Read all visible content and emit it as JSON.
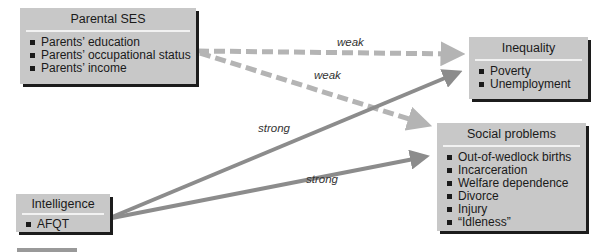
{
  "nodes": {
    "parental_ses": {
      "title": "Parental SES",
      "items": [
        "Parents’ education",
        "Parents’ occupational status",
        "Parents’ income"
      ]
    },
    "intelligence": {
      "title": "Intelligence",
      "items": [
        "AFQT"
      ]
    },
    "inequality": {
      "title": "Inequality",
      "items": [
        "Poverty",
        "Unemployment"
      ]
    },
    "social_problems": {
      "title": "Social problems",
      "items": [
        "Out-of-wedlock births",
        "Incarceration",
        "Welfare dependence",
        "Divorce",
        "Injury",
        "“Idleness”"
      ]
    }
  },
  "edges": [
    {
      "from": "Parental SES",
      "to": "Inequality",
      "label": "weak",
      "style": "dashed"
    },
    {
      "from": "Parental SES",
      "to": "Social problems",
      "label": "weak",
      "style": "dashed"
    },
    {
      "from": "Intelligence",
      "to": "Inequality",
      "label": "strong",
      "style": "solid"
    },
    {
      "from": "Intelligence",
      "to": "Social problems",
      "label": "strong",
      "style": "solid"
    }
  ],
  "colors": {
    "box_fill": "#c8c8c8",
    "shadow": "#1c1c1c",
    "weak_arrow": "#b4b4b4",
    "strong_arrow": "#8c8c8c"
  }
}
